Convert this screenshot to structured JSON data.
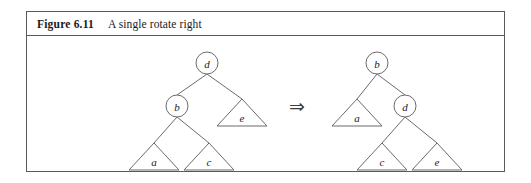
{
  "figure": {
    "label": "Figure 6.11",
    "caption": "A single rotate right",
    "border_color": "#5a5a5a",
    "background": "#ffffff"
  },
  "diagram": {
    "stroke_color": "#6b6b6b",
    "text_color": "#1a1a1a",
    "transform_symbol": "⇒",
    "left_tree": {
      "name": "before-rotation",
      "nodes": [
        {
          "id": "d",
          "label": "d",
          "shape": "circle",
          "x": 180,
          "y": 27,
          "r": 11
        },
        {
          "id": "b",
          "label": "b",
          "shape": "circle",
          "x": 150,
          "y": 70,
          "r": 11
        },
        {
          "id": "e",
          "label": "e",
          "shape": "triangle",
          "x": 215,
          "y": 63,
          "half": 25,
          "h": 27
        },
        {
          "id": "a",
          "label": "a",
          "shape": "triangle",
          "x": 127,
          "y": 107,
          "half": 25,
          "h": 27
        },
        {
          "id": "c",
          "label": "c",
          "shape": "triangle",
          "x": 182,
          "y": 107,
          "half": 25,
          "h": 27
        }
      ],
      "edges": [
        {
          "from": "d",
          "to": "b"
        },
        {
          "from": "d",
          "to": "e"
        },
        {
          "from": "b",
          "to": "a"
        },
        {
          "from": "b",
          "to": "c"
        }
      ]
    },
    "right_tree": {
      "name": "after-rotation",
      "nodes": [
        {
          "id": "b",
          "label": "b",
          "shape": "circle",
          "x": 350,
          "y": 27,
          "r": 11
        },
        {
          "id": "a",
          "label": "a",
          "shape": "triangle",
          "x": 330,
          "y": 63,
          "half": 25,
          "h": 27
        },
        {
          "id": "d",
          "label": "d",
          "shape": "circle",
          "x": 378,
          "y": 70,
          "r": 11
        },
        {
          "id": "c",
          "label": "c",
          "shape": "triangle",
          "x": 355,
          "y": 107,
          "half": 25,
          "h": 27
        },
        {
          "id": "e",
          "label": "e",
          "shape": "triangle",
          "x": 410,
          "y": 107,
          "half": 25,
          "h": 27
        }
      ],
      "edges": [
        {
          "from": "b",
          "to": "a"
        },
        {
          "from": "b",
          "to": "d"
        },
        {
          "from": "d",
          "to": "c"
        },
        {
          "from": "d",
          "to": "e"
        }
      ]
    },
    "arrow": {
      "x": 270,
      "y": 70
    }
  }
}
